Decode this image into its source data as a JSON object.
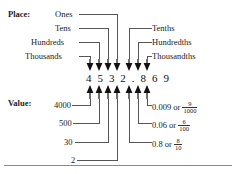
{
  "row_labels": {
    "place": "Place:",
    "value": "Value:"
  },
  "number": {
    "text": "4 5 3 2 . 8 6 9",
    "plain": "4532.869",
    "digits": [
      "4",
      "5",
      "3",
      "2",
      ".",
      "8",
      "6",
      "9"
    ]
  },
  "place_labels_left": [
    {
      "label": "Ones"
    },
    {
      "label": "Tens"
    },
    {
      "label": "Hundreds"
    },
    {
      "label": "Thousands"
    }
  ],
  "place_labels_right": [
    {
      "label": "Tenths"
    },
    {
      "label": "Hundredths"
    },
    {
      "label": "Thousandths"
    }
  ],
  "value_labels_left": [
    {
      "label": "4000"
    },
    {
      "label": "500"
    },
    {
      "label": "30"
    },
    {
      "label": "2"
    }
  ],
  "value_labels_right": [
    {
      "decimal": "0.009",
      "conj": "or",
      "num": "9",
      "den": "1000"
    },
    {
      "decimal": "0.06",
      "conj": "or",
      "num": "6",
      "den": "100"
    },
    {
      "decimal": "0.8",
      "conj": "or",
      "num": "8",
      "den": "10"
    }
  ],
  "icons": {
    "arrow_down": "down-arrow-icon",
    "arrow_up": "up-arrow-icon"
  },
  "colors": {
    "text": "#1a1a1a",
    "line": "#555555",
    "arrow": "#111111",
    "background": "#ffffff",
    "divider": "#888888"
  }
}
